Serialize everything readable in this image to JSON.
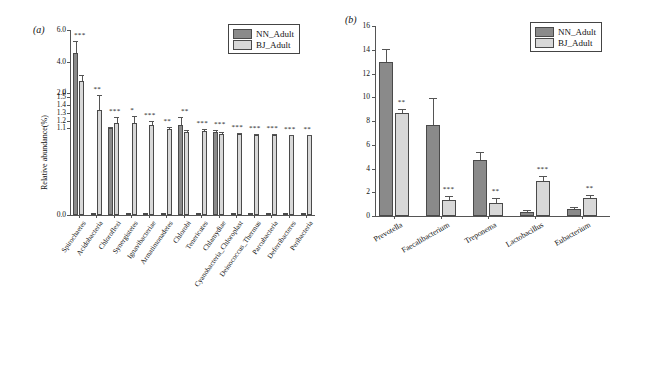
{
  "figure": {
    "panel_a_tag": "(a)",
    "panel_b_tag": "(b)"
  },
  "legend": {
    "items": [
      {
        "label": "NN_Adult",
        "color": "#8a8a8a"
      },
      {
        "label": "BJ_Adult",
        "color": "#d8d8d8"
      }
    ]
  },
  "chart_data": [
    {
      "type": "bar",
      "panel": "(a)",
      "title": "",
      "xlabel": "",
      "ylabel": "Relative abundance(%)",
      "axis_broken": true,
      "ylim_lower": [
        0.0,
        1.5
      ],
      "ylim_upper": [
        2.0,
        6.0
      ],
      "yticks_lower": [
        "0.0",
        "1.1",
        "1.2",
        "1.3",
        "1.4",
        "1.5"
      ],
      "yticks_upper": [
        "2.0",
        "4.0",
        "6.0"
      ],
      "break_symbol": "//",
      "grid": false,
      "legend_position": "top-right",
      "categories": [
        "Spirochaetes",
        "Acidobacteria",
        "Chloroflexi",
        "Synergistetes",
        "Ignavibacteriae",
        "Armatimonadetes",
        "Chlorobi",
        "Tenericutes",
        "Chlamydiae",
        "Cyanobacteria_Chloroplast",
        "Deinococcus_Thermus",
        "Parcubacteria",
        "Deferribacteres",
        "Peribacteria"
      ],
      "series": [
        {
          "name": "NN_Adult",
          "values": [
            4.55,
            0.02,
            1.105,
            0.015,
            0.012,
            0.015,
            1.14,
            0.012,
            1.055,
            0.012,
            0.01,
            0.01,
            0.008,
            0.006
          ],
          "errors": [
            0.75,
            0.005,
            0.02,
            0.004,
            0.003,
            0.004,
            0.1,
            0.003,
            0.02,
            0.003,
            0.003,
            0.003,
            0.002,
            0.002
          ]
        },
        {
          "name": "BJ_Adult",
          "values": [
            1.7,
            1.33,
            1.175,
            1.175,
            1.145,
            1.09,
            1.05,
            1.065,
            1.035,
            1.025,
            1.022,
            1.018,
            1.015,
            1.012
          ],
          "errors": [
            0.08,
            0.19,
            0.075,
            0.085,
            0.055,
            0.035,
            0.025,
            0.03,
            0.018,
            0.012,
            0.01,
            0.01,
            0.008,
            0.008
          ]
        }
      ],
      "significance": [
        {
          "category": "Spirochaetes",
          "marks": "***"
        },
        {
          "category": "Acidobacteria",
          "marks": "**"
        },
        {
          "category": "Chloroflexi",
          "marks": "***"
        },
        {
          "category": "Synergistetes",
          "marks": "*"
        },
        {
          "category": "Ignavibacteriae",
          "marks": "***"
        },
        {
          "category": "Armatimonadetes",
          "marks": "**"
        },
        {
          "category": "Chlorobi",
          "marks": "**"
        },
        {
          "category": "Tenericutes",
          "marks": "***"
        },
        {
          "category": "Chlamydiae",
          "marks": "***"
        },
        {
          "category": "Cyanobacteria_Chloroplast",
          "marks": "***"
        },
        {
          "category": "Deinococcus_Thermus",
          "marks": "***"
        },
        {
          "category": "Parcubacteria",
          "marks": "***"
        },
        {
          "category": "Deferribacteres",
          "marks": "***"
        },
        {
          "category": "Peribacteria",
          "marks": "**"
        }
      ]
    },
    {
      "type": "bar",
      "panel": "(b)",
      "title": "",
      "xlabel": "",
      "ylabel": "",
      "axis_broken": false,
      "ylim": [
        0,
        16
      ],
      "yticks": [
        "0",
        "2",
        "4",
        "6",
        "8",
        "10",
        "12",
        "14",
        "16"
      ],
      "grid": false,
      "legend_position": "top-right",
      "categories": [
        "Prevotella",
        "Faecalibacterium",
        "Treponema",
        "Lactobacillus",
        "Eubacterium"
      ],
      "series": [
        {
          "name": "NN_Adult",
          "values": [
            13.0,
            7.7,
            4.7,
            0.35,
            0.6
          ],
          "errors": [
            1.1,
            2.2,
            0.7,
            0.12,
            0.12
          ]
        },
        {
          "name": "BJ_Adult",
          "values": [
            8.65,
            1.35,
            1.1,
            2.95,
            1.5
          ],
          "errors": [
            0.35,
            0.3,
            0.45,
            0.4,
            0.25
          ]
        }
      ],
      "significance": [
        {
          "category": "Prevotella",
          "marks": "**"
        },
        {
          "category": "Faecalibacterium",
          "marks": "***"
        },
        {
          "category": "Treponema",
          "marks": "**"
        },
        {
          "category": "Lactobacillus",
          "marks": "***"
        },
        {
          "category": "Eubacterium",
          "marks": "**"
        }
      ]
    }
  ]
}
